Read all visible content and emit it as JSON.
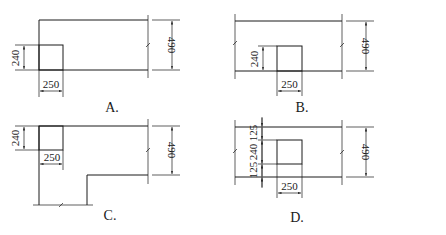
{
  "diagram": {
    "panels": [
      {
        "label": "A.",
        "dims": {
          "column_depth": "240",
          "column_width": "250",
          "wall_thickness": "490"
        }
      },
      {
        "label": "B.",
        "dims": {
          "column_depth": "240",
          "column_width": "250",
          "wall_thickness": "490"
        }
      },
      {
        "label": "C.",
        "dims": {
          "column_depth": "240",
          "column_width": "250",
          "wall_thickness": "490"
        }
      },
      {
        "label": "D.",
        "dims": {
          "offset_top": "125",
          "column_depth": "240",
          "offset_bottom": "125",
          "column_width": "250",
          "wall_thickness": "490"
        }
      }
    ]
  }
}
